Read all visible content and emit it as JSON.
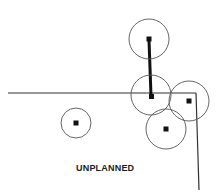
{
  "diagram": {
    "caption": "UNPLANNED",
    "colors": {
      "stroke": "#333333",
      "background": "#ffffff"
    },
    "nodes": [
      {
        "id": "top",
        "cx": 149,
        "cy": 39,
        "r": 20
      },
      {
        "id": "middle",
        "cx": 151,
        "cy": 95,
        "r": 20
      },
      {
        "id": "right",
        "cx": 189,
        "cy": 101,
        "r": 20
      },
      {
        "id": "bottom",
        "cx": 166,
        "cy": 129,
        "r": 20
      },
      {
        "id": "left",
        "cx": 76,
        "cy": 123,
        "r": 15
      }
    ],
    "edges": [
      {
        "from": "top",
        "to": "middle",
        "style": "thick"
      }
    ],
    "boundary": {
      "horizontal": {
        "x1": 8,
        "y1": 93,
        "x2": 196,
        "y2": 93
      },
      "vertical": {
        "x1": 196,
        "y1": 93,
        "x2": 199,
        "y2": 190
      }
    }
  }
}
